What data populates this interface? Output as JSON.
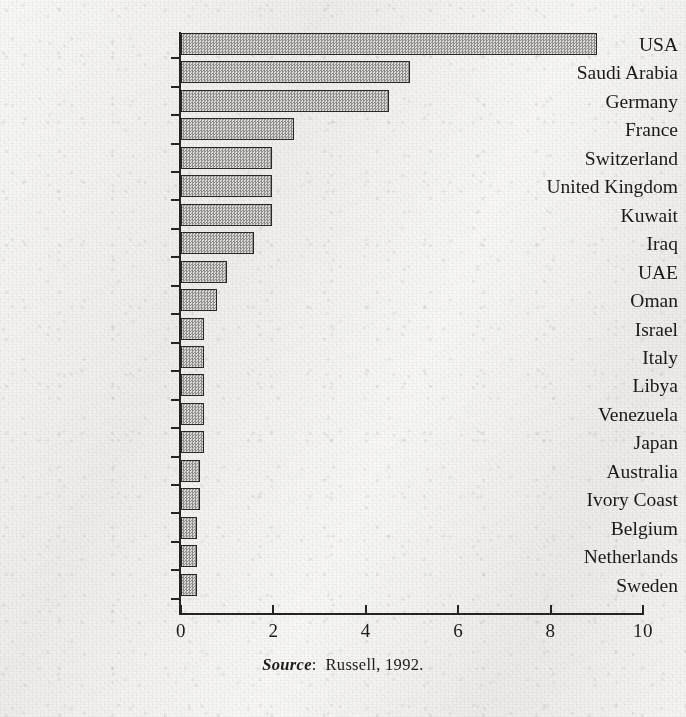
{
  "chart_data": {
    "type": "bar",
    "orientation": "horizontal",
    "title": "",
    "subtitle": "",
    "xlabel": "",
    "ylabel": "",
    "xlim": [
      0,
      10
    ],
    "grid": false,
    "legend": null,
    "xticks": [
      "0",
      "2",
      "4",
      "6",
      "8",
      "10"
    ],
    "xtick_values": [
      0,
      2,
      4,
      6,
      8,
      10
    ],
    "categories": [
      "USA",
      "Saudi Arabia",
      "Germany",
      "France",
      "Switzerland",
      "United Kingdom",
      "Kuwait",
      "Iraq",
      "UAE",
      "Oman",
      "Israel",
      "Italy",
      "Libya",
      "Venezuela",
      "Japan",
      "Australia",
      "Ivory Coast",
      "Belgium",
      "Netherlands",
      "Sweden"
    ],
    "values": [
      9.0,
      4.95,
      4.5,
      2.45,
      1.98,
      1.98,
      1.98,
      1.58,
      1.0,
      0.78,
      0.5,
      0.5,
      0.5,
      0.5,
      0.5,
      0.42,
      0.42,
      0.35,
      0.35,
      0.35
    ],
    "annotations": []
  },
  "caption": {
    "source_word": "Source",
    "source_separator": ":",
    "source_reference": "Russell, 1992."
  },
  "style": {
    "paper_color": "#f1f0ee",
    "ink_color": "#1d1b19",
    "bar_fill_light": "#dcdbd7",
    "bar_fill_dark": "#8f8e8a",
    "bar_border_color": "#2a2826"
  }
}
